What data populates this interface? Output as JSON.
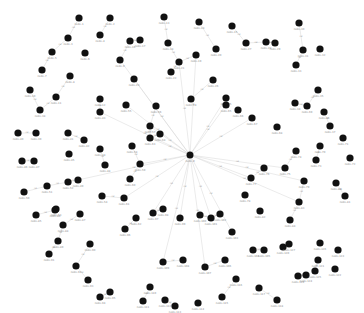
{
  "graph": {
    "type": "force-directed network",
    "colors": {
      "node": "#111111",
      "edge": "#d6d6d6",
      "node_label": "#8a8a8a",
      "edge_label": "#a8a8a8",
      "background": "#ffffff"
    },
    "hub": {
      "id": "hub",
      "x": 190,
      "y": 155,
      "r": 3.5,
      "label": "node-0"
    },
    "nodes": [
      [
        79,
        18
      ],
      [
        110,
        18
      ],
      [
        68,
        38
      ],
      [
        100,
        35
      ],
      [
        52,
        52
      ],
      [
        85,
        53
      ],
      [
        42,
        70
      ],
      [
        70,
        76
      ],
      [
        120,
        60
      ],
      [
        30,
        90
      ],
      [
        56,
        97
      ],
      [
        100,
        99
      ],
      [
        164,
        17
      ],
      [
        199,
        22
      ],
      [
        232,
        26
      ],
      [
        130,
        41
      ],
      [
        140,
        40
      ],
      [
        168,
        43
      ],
      [
        196,
        55
      ],
      [
        216,
        49
      ],
      [
        179,
        62
      ],
      [
        171,
        72
      ],
      [
        134,
        79
      ],
      [
        191,
        99
      ],
      [
        226,
        98
      ],
      [
        213,
        80
      ],
      [
        246,
        43
      ],
      [
        266,
        42
      ],
      [
        275,
        43
      ],
      [
        299,
        23
      ],
      [
        303,
        50
      ],
      [
        320,
        49
      ],
      [
        296,
        65
      ],
      [
        295,
        103
      ],
      [
        318,
        90
      ],
      [
        324,
        112
      ],
      [
        330,
        126
      ],
      [
        40,
        110
      ],
      [
        36,
        133
      ],
      [
        18,
        133
      ],
      [
        68,
        133
      ],
      [
        84,
        140
      ],
      [
        100,
        112
      ],
      [
        100,
        149
      ],
      [
        69,
        154
      ],
      [
        22,
        161
      ],
      [
        34,
        161
      ],
      [
        105,
        165
      ],
      [
        78,
        180
      ],
      [
        24,
        192
      ],
      [
        47,
        186
      ],
      [
        68,
        182
      ],
      [
        56,
        209
      ],
      [
        102,
        196
      ],
      [
        126,
        105
      ],
      [
        156,
        106
      ],
      [
        150,
        126
      ],
      [
        132,
        146
      ],
      [
        140,
        164
      ],
      [
        130,
        179
      ],
      [
        124,
        198
      ],
      [
        136,
        218
      ],
      [
        150,
        138
      ],
      [
        160,
        134
      ],
      [
        226,
        105
      ],
      [
        238,
        110
      ],
      [
        252,
        118
      ],
      [
        277,
        127
      ],
      [
        307,
        106
      ],
      [
        320,
        146
      ],
      [
        343,
        138
      ],
      [
        350,
        158
      ],
      [
        316,
        160
      ],
      [
        296,
        151
      ],
      [
        285,
        168
      ],
      [
        264,
        168
      ],
      [
        251,
        178
      ],
      [
        245,
        195
      ],
      [
        304,
        181
      ],
      [
        336,
        183
      ],
      [
        345,
        196
      ],
      [
        260,
        211
      ],
      [
        299,
        202
      ],
      [
        290,
        220
      ],
      [
        36,
        215
      ],
      [
        55,
        210
      ],
      [
        80,
        214
      ],
      [
        63,
        225
      ],
      [
        58,
        241
      ],
      [
        90,
        244
      ],
      [
        49,
        254
      ],
      [
        76,
        266
      ],
      [
        88,
        280
      ],
      [
        100,
        297
      ],
      [
        110,
        292
      ],
      [
        125,
        229
      ],
      [
        153,
        213
      ],
      [
        163,
        209
      ],
      [
        180,
        218
      ],
      [
        200,
        215
      ],
      [
        211,
        218
      ],
      [
        220,
        214
      ],
      [
        232,
        232
      ],
      [
        253,
        250
      ],
      [
        264,
        250
      ],
      [
        225,
        260
      ],
      [
        205,
        267
      ],
      [
        183,
        260
      ],
      [
        163,
        262
      ],
      [
        150,
        287
      ],
      [
        143,
        301
      ],
      [
        165,
        300
      ],
      [
        175,
        306
      ],
      [
        198,
        303
      ],
      [
        222,
        297
      ],
      [
        236,
        279
      ],
      [
        259,
        288
      ],
      [
        277,
        300
      ],
      [
        298,
        276
      ],
      [
        283,
        247
      ],
      [
        318,
        260
      ],
      [
        335,
        269
      ],
      [
        338,
        250
      ],
      [
        306,
        275
      ],
      [
        315,
        271
      ],
      [
        320,
        243
      ],
      [
        289,
        244
      ]
    ],
    "node_label_prefix": "node-",
    "edge_label_text": "rel"
  }
}
